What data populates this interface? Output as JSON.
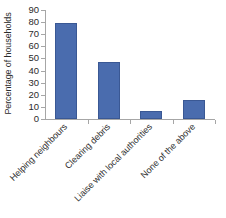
{
  "chart_data": {
    "type": "bar",
    "title": "",
    "xlabel": "",
    "ylabel": "Percentage of households",
    "categories": [
      "Helping neighbours",
      "Clearing debris",
      "Liaise with local authorities",
      "None of the above"
    ],
    "values": [
      79,
      47,
      7,
      16
    ],
    "ylim": [
      0,
      90
    ],
    "ytick_step": 10,
    "yticks": [
      90,
      80,
      70,
      60,
      50,
      40,
      30,
      20,
      10,
      0
    ],
    "grid": false,
    "legend": false,
    "legend_position": "none",
    "series": [
      {
        "name": "Percentage of households",
        "values": [
          79,
          47,
          7,
          16
        ]
      }
    ],
    "bar_color": "#4a6cae",
    "bar_edge_color": "#3a5894",
    "axis_color": "#a6a6a6",
    "tick_label_rotation": -45
  }
}
